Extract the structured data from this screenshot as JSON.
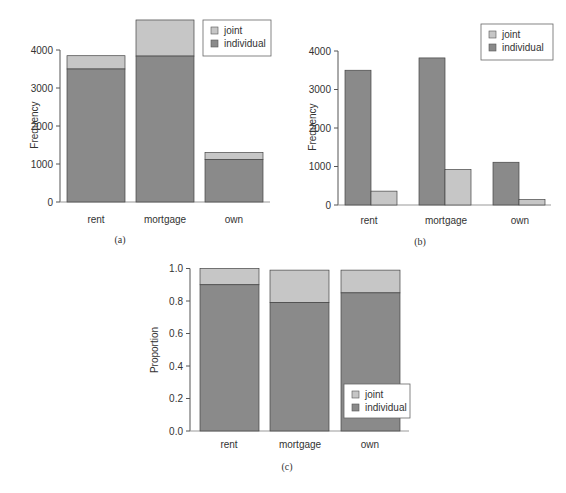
{
  "colors": {
    "individual": "#8a8a8a",
    "joint": "#c6c6c6",
    "axis": "#555555",
    "bar_edge": "#444444"
  },
  "legend": {
    "joint": "joint",
    "individual": "individual"
  },
  "chart_data": [
    {
      "id": "a",
      "caption": "(a)",
      "type": "bar",
      "stacked": true,
      "categories": [
        "rent",
        "mortgage",
        "own"
      ],
      "series": [
        {
          "name": "individual",
          "values": [
            3500,
            3840,
            1120
          ]
        },
        {
          "name": "joint",
          "values": [
            350,
            950,
            180
          ]
        }
      ],
      "xlabel": "",
      "ylabel": "Frequency",
      "yticks": [
        0,
        1000,
        2000,
        3000,
        4000
      ],
      "ylim": [
        0,
        4900
      ],
      "grid": false,
      "legend_position": "top-right"
    },
    {
      "id": "b",
      "caption": "(b)",
      "type": "bar",
      "stacked": false,
      "categories": [
        "rent",
        "mortgage",
        "own"
      ],
      "series": [
        {
          "name": "individual",
          "values": [
            3500,
            3820,
            1110
          ]
        },
        {
          "name": "joint",
          "values": [
            360,
            920,
            140
          ]
        }
      ],
      "xlabel": "",
      "ylabel": "Frequency",
      "yticks": [
        0,
        1000,
        2000,
        3000,
        4000
      ],
      "ylim": [
        0,
        4000
      ],
      "grid": false,
      "legend_position": "top-right"
    },
    {
      "id": "c",
      "caption": "(c)",
      "type": "bar",
      "stacked": true,
      "categories": [
        "rent",
        "mortgage",
        "own"
      ],
      "series": [
        {
          "name": "individual",
          "values": [
            0.9,
            0.79,
            0.85
          ]
        },
        {
          "name": "joint",
          "values": [
            0.1,
            0.2,
            0.14
          ]
        }
      ],
      "xlabel": "",
      "ylabel": "Proportion",
      "yticks": [
        "0.0",
        "0.2",
        "0.4",
        "0.6",
        "0.8",
        "1.0"
      ],
      "ylim": [
        0,
        1.0
      ],
      "grid": false,
      "legend_position": "bottom-right"
    }
  ]
}
